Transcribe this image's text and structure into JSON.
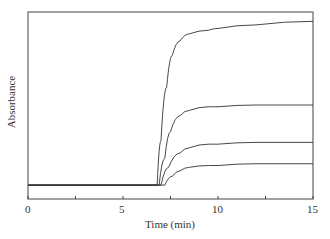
{
  "chart_data": {
    "type": "line",
    "title": "",
    "xlabel": "Time (min)",
    "ylabel": "Absorbance",
    "xlim": [
      0,
      15
    ],
    "ylim": [
      0,
      1
    ],
    "xticks": [
      0,
      5,
      10,
      15
    ],
    "grid": false,
    "legend": null,
    "series": [
      {
        "name": "curve 1",
        "x": [
          0,
          6.8,
          7.0,
          7.3,
          7.6,
          8.0,
          8.5,
          9.5,
          10,
          12,
          15
        ],
        "values": [
          0.05,
          0.05,
          0.3,
          0.6,
          0.78,
          0.86,
          0.9,
          0.92,
          0.93,
          0.95,
          0.97
        ]
      },
      {
        "name": "curve 2",
        "x": [
          0,
          6.9,
          7.2,
          7.5,
          8.0,
          8.5,
          9.5,
          10,
          12,
          15
        ],
        "values": [
          0.05,
          0.05,
          0.2,
          0.35,
          0.44,
          0.47,
          0.49,
          0.49,
          0.5,
          0.5
        ]
      },
      {
        "name": "curve 3",
        "x": [
          0,
          7.0,
          7.4,
          8.0,
          8.5,
          9.5,
          10,
          12,
          15
        ],
        "values": [
          0.05,
          0.05,
          0.15,
          0.23,
          0.26,
          0.28,
          0.28,
          0.29,
          0.29
        ]
      },
      {
        "name": "curve 4",
        "x": [
          0,
          7.2,
          7.6,
          8.0,
          8.5,
          9.5,
          10,
          12,
          15
        ],
        "values": [
          0.05,
          0.05,
          0.1,
          0.13,
          0.15,
          0.16,
          0.16,
          0.17,
          0.17
        ]
      }
    ]
  },
  "labels": {
    "x": "Time (min)",
    "y": "Absorbance",
    "ticks": [
      "0",
      "5",
      "10",
      "15"
    ]
  }
}
